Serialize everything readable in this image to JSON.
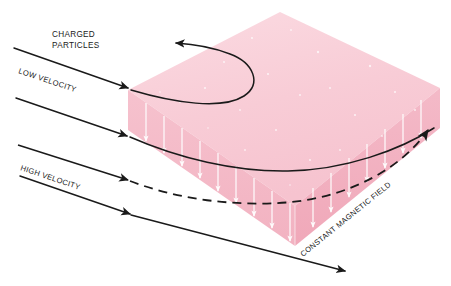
{
  "figure": {
    "background_color": "#ffffff"
  },
  "labels": {
    "charged_particles_line1": "CHARGED",
    "charged_particles_line2": "PARTICLES",
    "low_velocity": "LOW VELOCITY",
    "high_velocity": "HIGH VELOCITY",
    "constant_magnetic_field": "CONSTANT MAGNETIC FIELD"
  },
  "colors": {
    "top_face": "#f8ccd6",
    "top_face_light": "#fbdbe2",
    "front_left_face": "#f4b9c7",
    "front_right_face": "#f2aebd",
    "right_edge_face": "#efa3b4",
    "field_line": "#ffffff",
    "trajectory": "#1a1a1a",
    "text": "#1a1a1a"
  },
  "field_region": {
    "shape": "slab",
    "field_direction": "downward",
    "field_line_count": 17,
    "top_apex": [
      280,
      12
    ],
    "left_vertex": [
      128,
      90
    ],
    "right_vertex": [
      440,
      128
    ],
    "front_vertex": [
      295,
      246
    ],
    "slab_thickness_px": 40
  },
  "trajectories": [
    {
      "name": "low-velocity-particle",
      "style": "solid",
      "entry": [
        14,
        48
      ],
      "enters_field_at": [
        131,
        90
      ],
      "behavior": "tight U-turn, exits back out the top-left",
      "exit_arrow": [
        171,
        42
      ]
    },
    {
      "name": "medium-velocity-particle",
      "style": "solid",
      "entry": [
        16,
        98
      ],
      "enters_field_at": [
        130,
        137
      ],
      "behavior": "gentle downward curve",
      "exit_arrow": null
    },
    {
      "name": "high-velocity-particle",
      "style": "dashed",
      "entry": [
        18,
        145
      ],
      "enters_field_at": [
        130,
        180
      ],
      "behavior": "shallow arc across the slab, exits upper right",
      "exit_arrow": [
        430,
        126
      ]
    },
    {
      "name": "undeflected-ray",
      "style": "solid",
      "entry": [
        20,
        176
      ],
      "enters_field_at": [
        131,
        182
      ],
      "behavior": "passes beneath the slab to lower right",
      "exit_arrow": [
        347,
        272
      ]
    }
  ]
}
